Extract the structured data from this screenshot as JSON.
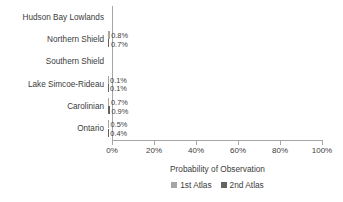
{
  "chart_data": {
    "type": "bar",
    "orientation": "horizontal",
    "title": "",
    "xlabel": "Probability of Observation",
    "ylabel": "",
    "xlim": [
      0,
      100
    ],
    "xunit": "%",
    "grid": false,
    "legend_position": "bottom",
    "categories": [
      "Hudson Bay Lowlands",
      "Northern Shield",
      "Southern Shield",
      "Lake Simcoe-Rideau",
      "Carolinian",
      "Ontario"
    ],
    "xticks": [
      "0%",
      "20%",
      "40%",
      "60%",
      "80%",
      "100%"
    ],
    "xtick_values": [
      0,
      20,
      40,
      60,
      80,
      100
    ],
    "series": [
      {
        "name": "1st Atlas",
        "color": "#a5a5a5",
        "values": [
          0.0,
          0.8,
          0.0,
          0.1,
          0.7,
          0.5
        ],
        "labels": [
          "",
          "0.8%",
          "",
          "0.1%",
          "0.7%",
          "0.5%"
        ]
      },
      {
        "name": "2nd Atlas",
        "color": "#636363",
        "values": [
          0.0,
          0.7,
          0.0,
          0.1,
          0.9,
          0.4
        ],
        "labels": [
          "",
          "0.7%",
          "",
          "0.1%",
          "0.9%",
          "0.4%"
        ]
      }
    ]
  },
  "axis": {
    "line_color": "#a6a6a6"
  }
}
